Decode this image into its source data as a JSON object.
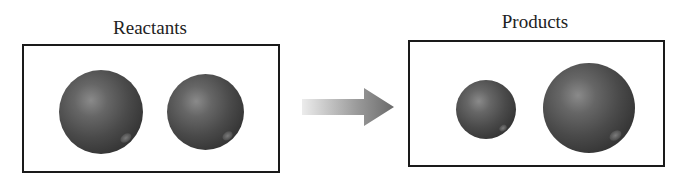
{
  "reactants": {
    "label": "Reactants",
    "spheres": [
      {
        "name": "reactant-1",
        "size": "large"
      },
      {
        "name": "reactant-2",
        "size": "large"
      }
    ]
  },
  "products": {
    "label": "Products",
    "spheres": [
      {
        "name": "product-1",
        "size": "small"
      },
      {
        "name": "product-2",
        "size": "extra-large"
      }
    ]
  },
  "arrow": {
    "direction": "right",
    "meaning": "reaction-arrow"
  },
  "colors": {
    "sphere": "#4a4a4a",
    "border": "#1a1a1a",
    "arrow_end": "#6a6a6a",
    "arrow_start": "#e0e0e0"
  }
}
